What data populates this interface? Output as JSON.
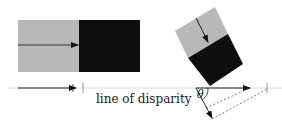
{
  "diagram": {
    "label_line": "line of disparity",
    "label_angle": "θ",
    "colors": {
      "light": "#b8b8b8",
      "dark": "#0e0e0e",
      "line": "#333333",
      "baseline": "#cccccc"
    },
    "left_panel": {
      "description": "Axis-aligned edge: gray half left, black half right, arrow pointing right to the edge"
    },
    "right_panel": {
      "description": "Rotated edge: gray half top, black half bottom, arrow perpendicular to edge; projected onto line of disparity with angle theta"
    }
  }
}
